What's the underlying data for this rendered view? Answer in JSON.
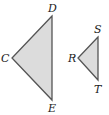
{
  "diagram": {
    "type": "similar-triangles",
    "fill_color": "#dcdcdc",
    "stroke_color": "#555555",
    "triangles": [
      {
        "name": "CDE",
        "vertices": {
          "D": {
            "label": "D",
            "x": 52,
            "y": 16
          },
          "C": {
            "label": "C",
            "x": 12,
            "y": 58
          },
          "E": {
            "label": "E",
            "x": 52,
            "y": 100
          }
        }
      },
      {
        "name": "RST",
        "vertices": {
          "S": {
            "label": "S",
            "x": 98,
            "y": 37
          },
          "R": {
            "label": "R",
            "x": 78,
            "y": 58
          },
          "T": {
            "label": "T",
            "x": 98,
            "y": 80
          }
        }
      }
    ]
  }
}
